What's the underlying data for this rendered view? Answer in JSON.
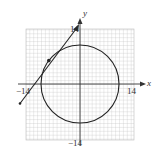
{
  "figure": {
    "axes": {
      "x_label": "x",
      "y_label": "y",
      "x_min_label": "−14",
      "x_max_label": "14",
      "y_max_label": "14",
      "y_min_label": "−14",
      "range": [
        -14,
        14
      ]
    },
    "circle": {
      "center": [
        0,
        0
      ],
      "radius": 10
    },
    "tangent_line": {
      "point_of_tangency": [
        -8,
        6
      ],
      "slope": "4/3"
    },
    "colors": {
      "grid": "#bdbdbd",
      "axis": "#333333",
      "curve": "#222222",
      "background": "#ffffff"
    }
  }
}
